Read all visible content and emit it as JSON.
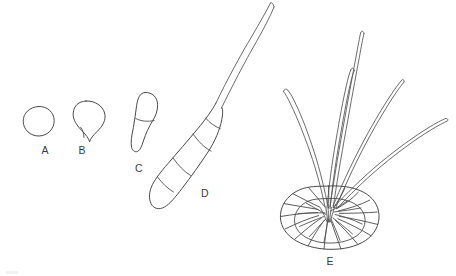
{
  "figure": {
    "caption_present": false,
    "background_color": "#ffffff",
    "ink_color": "#4a4a4a",
    "label_color": "#3d3d3d",
    "width": 456,
    "height": 276,
    "panels": [
      {
        "id": "A",
        "label": "A",
        "name": "spore-stage-a",
        "description": "single rounded unicellular spore, no septa",
        "septa_count": 0,
        "appendage_count": 0,
        "label_x": 45,
        "label_y": 154
      },
      {
        "id": "B",
        "label": "B",
        "name": "spore-stage-b",
        "description": "pear shaped spore with basal notch, no septa",
        "septa_count": 0,
        "appendage_count": 0,
        "label_x": 82,
        "label_y": 154
      },
      {
        "id": "C",
        "label": "C",
        "name": "spore-stage-c",
        "description": "elongate two celled spore with one transverse septum",
        "septa_count": 1,
        "appendage_count": 0,
        "label_x": 139,
        "label_y": 172
      },
      {
        "id": "D",
        "label": "D",
        "name": "spore-stage-d",
        "description": "fusiform multiseptate spore with long apical appendage",
        "septa_count": 4,
        "appendage_count": 1,
        "label_x": 205,
        "label_y": 197
      },
      {
        "id": "E",
        "label": "E",
        "name": "spore-stage-e",
        "description": "mature rosette of radiating lobed cells with five long appendages",
        "septa_count": 0,
        "appendage_count": 5,
        "cell_count": 16,
        "label_x": 330,
        "label_y": 265
      }
    ]
  }
}
